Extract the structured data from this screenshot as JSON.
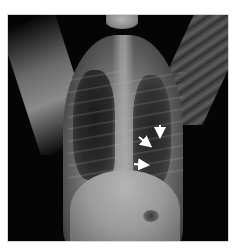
{
  "image": {
    "subject": "chest radiograph (frontal view)",
    "background_color": "#050505",
    "page_background": "#ffffff",
    "annotations": [
      {
        "type": "arrow",
        "direction": "down",
        "label": "arrow-1"
      },
      {
        "type": "arrow",
        "direction": "down-right",
        "label": "arrow-2"
      },
      {
        "type": "arrow",
        "direction": "right",
        "label": "arrow-3"
      }
    ],
    "arrow_color": "#ffffff"
  }
}
